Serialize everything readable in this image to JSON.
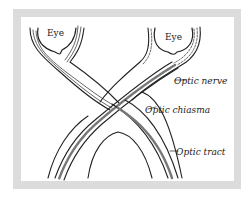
{
  "diagram": {
    "labels": {
      "eye_left": "Eye",
      "eye_right": "Eye",
      "optic_nerve": "Optic nerve",
      "optic_chiasma": "Optic chiasma",
      "optic_tract": "Optic tract"
    },
    "colors": {
      "frame": "#dcdcdc",
      "ink": "#222222",
      "background": "#ffffff"
    }
  }
}
